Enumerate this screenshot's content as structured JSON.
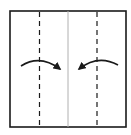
{
  "diagram": {
    "type": "origami-fold-step",
    "colors": {
      "background": "#ffffff",
      "paper_edge": "#1a1a1a",
      "center_crease": "#b0b0b0",
      "fold_line": "#1a1a1a",
      "arrow": "#1a1a1a"
    },
    "paper": {
      "x": 10,
      "y": 11,
      "width": 116,
      "height": 116
    },
    "center_crease": {
      "x": 68
    },
    "fold_lines": [
      {
        "name": "left-valley-fold",
        "x": 39.5,
        "style": "dashed"
      },
      {
        "name": "right-valley-fold",
        "x": 97,
        "style": "dashed"
      }
    ],
    "arrows": [
      {
        "name": "left-fold-arrow",
        "direction": "right",
        "path": "M21,66 Q40,54 60,69"
      },
      {
        "name": "right-fold-arrow",
        "direction": "left",
        "path": "M118,65 Q98,54 79,69"
      }
    ]
  }
}
